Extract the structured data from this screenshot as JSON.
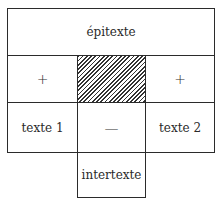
{
  "diagram": {
    "top": "épitexte",
    "middle_left": "+",
    "middle_center": "",
    "middle_right": "+",
    "bottom_left": "texte 1",
    "bottom_center": "—",
    "bottom_right": "texte 2",
    "below": "intertexte"
  }
}
